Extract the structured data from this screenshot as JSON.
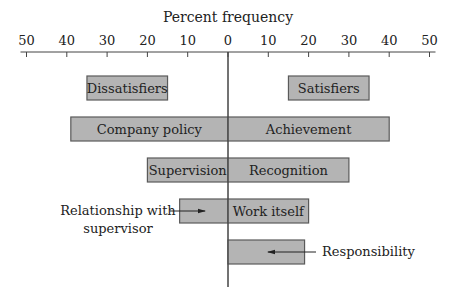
{
  "chart_data": {
    "type": "bar",
    "orientation": "horizontal-diverging",
    "title": "Percent frequency",
    "xlabel": "Percent frequency",
    "ylabel": "",
    "xlim": [
      -50,
      50
    ],
    "x_ticks": [
      -50,
      -40,
      -30,
      -20,
      -10,
      0,
      10,
      20,
      30,
      40,
      50
    ],
    "x_tick_labels": [
      "50",
      "40",
      "30",
      "20",
      "10",
      "0",
      "10",
      "20",
      "30",
      "40",
      "50"
    ],
    "grid": false,
    "legend": {
      "dissatisfiers_label": "Dissatisfiers",
      "satisfiers_label": "Satisfiers",
      "dissatisfiers_span": [
        -35,
        -15
      ],
      "satisfiers_span": [
        15,
        35
      ]
    },
    "series": [
      {
        "name": "Dissatisfiers",
        "side": "left",
        "categories": [
          "Company policy",
          "Supervision",
          "Relationship with supervisor"
        ],
        "values": [
          39,
          20,
          12
        ]
      },
      {
        "name": "Satisfiers",
        "side": "right",
        "categories": [
          "Achievement",
          "Recognition",
          "Work itself",
          "Responsibility"
        ],
        "values": [
          40,
          30,
          20,
          19
        ]
      }
    ],
    "rows": [
      {
        "left": {
          "label": "Company policy",
          "value": 39,
          "label_inside": true
        },
        "right": {
          "label": "Achievement",
          "value": 40,
          "label_inside": true
        }
      },
      {
        "left": {
          "label": "Supervision",
          "value": 20,
          "label_inside": true
        },
        "right": {
          "label": "Recognition",
          "value": 30,
          "label_inside": true
        }
      },
      {
        "left": {
          "label": "Relationship with supervisor",
          "value": 12,
          "label_inside": false
        },
        "right": {
          "label": "Work itself",
          "value": 20,
          "label_inside": true
        }
      },
      {
        "left": null,
        "right": {
          "label": "Responsibility",
          "value": 19,
          "label_inside": false
        }
      }
    ],
    "annotations": [
      {
        "text_lines": [
          "Relationship with",
          "supervisor"
        ],
        "points_to": "Relationship with supervisor"
      },
      {
        "text_lines": [
          "Responsibility"
        ],
        "points_to": "Responsibility"
      }
    ],
    "colors": {
      "bar_fill": "#b4b4b4",
      "bar_stroke": "#5a5a5a",
      "axis": "#444444",
      "text": "#222222"
    }
  }
}
